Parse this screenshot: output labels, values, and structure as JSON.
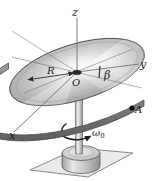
{
  "figure": {
    "background_color": "#ffffff",
    "labels": {
      "z_axis": "z",
      "y_axis": "y",
      "x_axis": "x",
      "radius": "R",
      "origin": "O",
      "tilt_angle": "β",
      "point_a": "A",
      "angular_velocity": "ω",
      "angular_velocity_subscript": "0"
    },
    "colors": {
      "disk_light": "#ffffff",
      "disk_mid": "#b9b9b9",
      "disk_dark": "#8a8a8a",
      "rim_edge": "#6f6f6f",
      "outline": "#3a3a3a",
      "axis_line": "#707070",
      "ground_fill": "#e4e4e4",
      "base_fill": "#c2c2c2",
      "column_fill": "#d4d4d4",
      "marker_dot": "#111111",
      "text": "#1a1a1a"
    },
    "elements": [
      {
        "name": "disk",
        "description": "large tilted circular disk with radial gradient shading"
      },
      {
        "name": "disk-rim",
        "description": "dark gray thickness band along lower disk edge"
      },
      {
        "name": "z-axis",
        "description": "vertical axis through origin pointing up"
      },
      {
        "name": "y-axis",
        "description": "axis extending to the right from origin"
      },
      {
        "name": "x-axis",
        "description": "axis extending to the lower left from origin"
      },
      {
        "name": "radius-arrow",
        "description": "double-headed arrow from origin to disk edge labeled R"
      },
      {
        "name": "tilt-angle-mark",
        "description": "short tick near origin marking angle beta"
      },
      {
        "name": "point-a-marker",
        "description": "black dot on disk rim labeled A"
      },
      {
        "name": "support-column",
        "description": "vertical cylindrical shaft below the disk"
      },
      {
        "name": "base-cylinder",
        "description": "short cylindrical pedestal at the bottom"
      },
      {
        "name": "ground-plane",
        "description": "parallelogram representing the floor"
      },
      {
        "name": "rotation-arrow",
        "description": "curved arrow around the column indicating spin"
      }
    ]
  }
}
